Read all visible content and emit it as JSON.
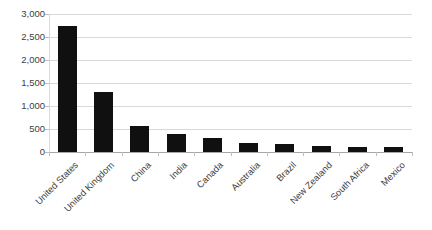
{
  "chart_data": {
    "type": "bar",
    "title": "",
    "subtitle": "",
    "xlabel": "",
    "ylabel": "",
    "categories": [
      "United States",
      "United Kingdom",
      "China",
      "India",
      "Canada",
      "Australia",
      "Brazil",
      "New Zealand",
      "South Africa",
      "Mexico"
    ],
    "values": [
      2750,
      1300,
      560,
      400,
      300,
      200,
      170,
      140,
      110,
      100
    ],
    "ylim": [
      0,
      3000
    ],
    "yticks": [
      0,
      500,
      1000,
      1500,
      2000,
      2500,
      3000
    ],
    "ytick_labels": [
      "0",
      "500",
      "1,000",
      "1,500",
      "2,000",
      "2,500",
      "3,000"
    ],
    "grid": true,
    "legend": false,
    "legend_position": "none",
    "bar_color": "#101010",
    "gridline_color": "#d9d9d9",
    "axis_color": "#a6a6a6",
    "label_rotation_degrees": -45
  }
}
